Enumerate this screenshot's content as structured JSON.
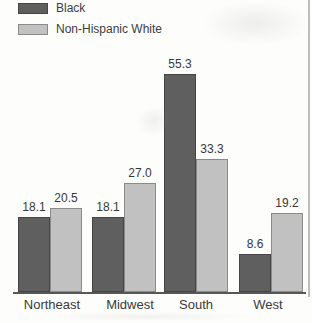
{
  "legend": {
    "items": [
      {
        "label": "Black",
        "color": "#5f5f5f",
        "border": "#454545"
      },
      {
        "label": "Non-Hispanic White",
        "color": "#c1c1c1",
        "border": "#8a8a8a"
      }
    ]
  },
  "chart_data": {
    "type": "bar",
    "title": "",
    "xlabel": "",
    "ylabel": "",
    "categories": [
      "Northeast",
      "Midwest",
      "South",
      "West"
    ],
    "series": [
      {
        "name": "Black",
        "color": "#5f5f5f",
        "border": "#454545",
        "values": [
          18.1,
          18.1,
          55.3,
          8.6
        ]
      },
      {
        "name": "Non-Hispanic White",
        "color": "#c1c1c1",
        "border": "#8a8a8a",
        "values": [
          20.5,
          27.0,
          33.3,
          19.2
        ]
      }
    ],
    "value_labels": [
      [
        "18.1",
        "20.5"
      ],
      [
        "18.1",
        "27.0"
      ],
      [
        "55.3",
        "33.3"
      ],
      [
        "8.6",
        "19.2"
      ]
    ],
    "ylim": [
      0,
      60
    ],
    "grid": false,
    "legend_position": "top-left",
    "bar_value_labels_shown": true,
    "y_axis_shown": false
  },
  "colors": {
    "axis": "#575757",
    "text": "#3a3a3a",
    "background": "#fdfdfc"
  }
}
